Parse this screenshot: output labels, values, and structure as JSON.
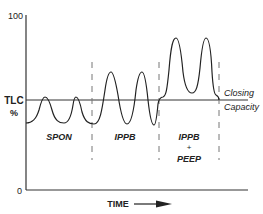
{
  "diagram": {
    "y_axis": {
      "label_top": "TLC",
      "label_bottom": "%",
      "tick_max": "100",
      "tick_min": "0"
    },
    "x_axis": {
      "label": "TIME",
      "arrow": "right-arrow"
    },
    "reference_line": {
      "label_top": "Closing",
      "label_bottom": "Capacity"
    },
    "segments": [
      {
        "label": "SPON"
      },
      {
        "label": "IPPB"
      },
      {
        "label_line1": "IPPB",
        "label_line2": "+",
        "label_line3": "PEEP"
      }
    ],
    "colors": {
      "line": "#222222",
      "dashed": "#777777",
      "background": "#ffffff"
    }
  }
}
